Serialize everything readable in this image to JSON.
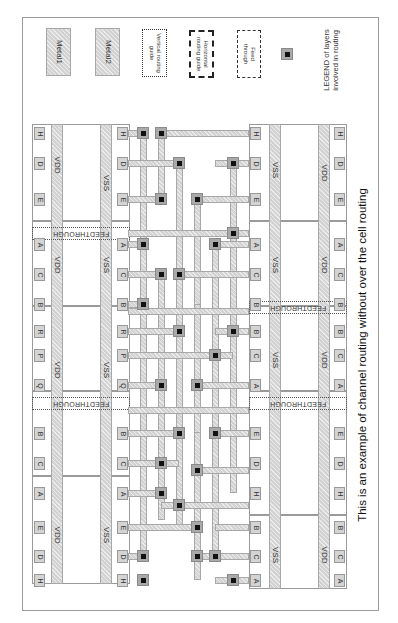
{
  "caption": "This is an example of channel routing without over the cell routing",
  "legend": {
    "title_line1": "LEGEND of layers",
    "title_line2": "involved in routing",
    "items": [
      {
        "id": "metal1",
        "label": "Metal1",
        "style": "hatched-fill"
      },
      {
        "id": "metal2",
        "label": "Metal2",
        "style": "hatched-fill"
      },
      {
        "id": "vertical-guide",
        "label_line1": "Vertical routing",
        "label_line2": "guide",
        "style": "dotted-border"
      },
      {
        "id": "horizontal-guide",
        "label_line1": "Horizontal",
        "label_line2": "routing guide",
        "style": "bold-dashed-border"
      },
      {
        "id": "feed-through",
        "label_line1": "Feed",
        "label_line2": "through",
        "style": "dashed-border"
      },
      {
        "id": "via",
        "label": "",
        "style": "via-square"
      }
    ]
  },
  "rails": {
    "vdd": "VDD",
    "vss": "VSS",
    "feedthrough": "FEEDTHROUGH"
  },
  "top_cell_row": {
    "outer_pins": [
      "H",
      "D",
      "E",
      "A",
      "C",
      "B",
      "R",
      "P",
      "Q",
      "B",
      "C",
      "A",
      "E",
      "D",
      "H"
    ],
    "inner_pins": [
      "H",
      "D",
      "E",
      "A",
      "C",
      "B",
      "R",
      "P",
      "Q",
      "B",
      "C",
      "A",
      "E",
      "D",
      "H"
    ],
    "rail_labels": [
      "VDD",
      "VDD",
      "VDD",
      "VDD"
    ],
    "vss_labels": [
      "VSS",
      "VSS",
      "VSS",
      "VSS"
    ]
  },
  "bottom_cell_row": {
    "inner_pins": [
      "H",
      "D",
      "E",
      "A",
      "C",
      "B",
      "B",
      "C",
      "A",
      "E",
      "D",
      "H",
      "B",
      "C",
      "A"
    ],
    "outer_pins": [
      "H",
      "D",
      "E",
      "A",
      "C",
      "B",
      "B",
      "C",
      "A",
      "E",
      "D",
      "H",
      "B",
      "C",
      "A"
    ],
    "rail_labels": [
      "VDD",
      "VDD",
      "VDD",
      "VDD"
    ],
    "vss_labels": [
      "VSS",
      "VSS",
      "VSS",
      "VSS"
    ]
  },
  "colors": {
    "metal": "#d2d2d2",
    "border": "#9a9a9a",
    "via": "#111111",
    "background": "#ffffff"
  }
}
